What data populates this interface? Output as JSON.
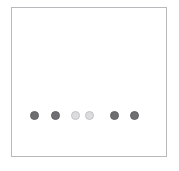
{
  "panel": {
    "background_color": "#ffffff",
    "border_color": "#b9b9bd",
    "frame_left": 11,
    "frame_top": 7,
    "frame_width": 156,
    "frame_height": 150
  },
  "indicator": {
    "name": "step-dot-indicator",
    "total_dots": 6,
    "filled_count": 4,
    "empty_count": 2,
    "filled_color": "#6f6f72",
    "filled_border_color": "#636366",
    "empty_color": "#dcdcde",
    "empty_border_color": "#c3c3c6",
    "row_center_y": 114,
    "dots": [
      {
        "index": 1,
        "state": "filled",
        "cx": 33,
        "cy": 114,
        "d": 9
      },
      {
        "index": 2,
        "state": "filled",
        "cx": 54,
        "cy": 114,
        "d": 9
      },
      {
        "index": 3,
        "state": "empty",
        "cx": 74,
        "cy": 114,
        "d": 9
      },
      {
        "index": 4,
        "state": "empty",
        "cx": 88,
        "cy": 114,
        "d": 9
      },
      {
        "index": 5,
        "state": "filled",
        "cx": 113,
        "cy": 114,
        "d": 9
      },
      {
        "index": 6,
        "state": "filled",
        "cx": 133,
        "cy": 114,
        "d": 9
      }
    ]
  }
}
